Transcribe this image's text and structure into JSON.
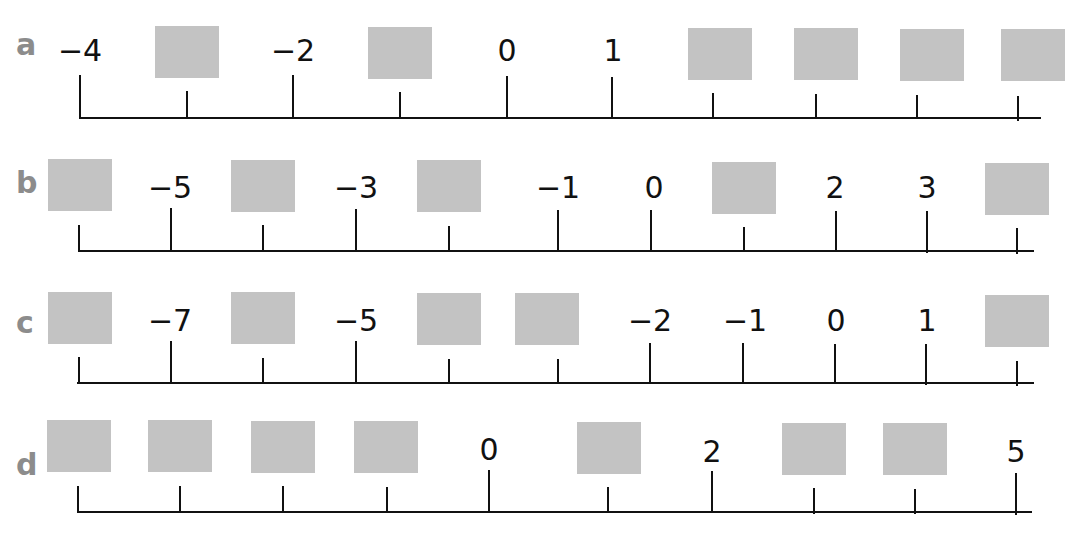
{
  "worksheet": {
    "header_fragment": "",
    "box_color": "#c3c3c3",
    "letter_color": "#8c8c8c",
    "line_color": "#111111"
  },
  "number_lines": [
    {
      "letter": "a",
      "positions": [
        {
          "value": "−4",
          "blank": false
        },
        {
          "value": "",
          "blank": true
        },
        {
          "value": "−2",
          "blank": false
        },
        {
          "value": "",
          "blank": true
        },
        {
          "value": "0",
          "blank": false
        },
        {
          "value": "1",
          "blank": false
        },
        {
          "value": "",
          "blank": true
        },
        {
          "value": "",
          "blank": true
        },
        {
          "value": "",
          "blank": true
        },
        {
          "value": "",
          "blank": true
        }
      ]
    },
    {
      "letter": "b",
      "positions": [
        {
          "value": "",
          "blank": true
        },
        {
          "value": "−5",
          "blank": false
        },
        {
          "value": "",
          "blank": true
        },
        {
          "value": "−3",
          "blank": false
        },
        {
          "value": "",
          "blank": true
        },
        {
          "value": "−1",
          "blank": false
        },
        {
          "value": "0",
          "blank": false
        },
        {
          "value": "",
          "blank": true
        },
        {
          "value": "2",
          "blank": false
        },
        {
          "value": "3",
          "blank": false
        },
        {
          "value": "",
          "blank": true
        }
      ]
    },
    {
      "letter": "c",
      "positions": [
        {
          "value": "",
          "blank": true
        },
        {
          "value": "−7",
          "blank": false
        },
        {
          "value": "",
          "blank": true
        },
        {
          "value": "−5",
          "blank": false
        },
        {
          "value": "",
          "blank": true
        },
        {
          "value": "",
          "blank": true
        },
        {
          "value": "−2",
          "blank": false
        },
        {
          "value": "−1",
          "blank": false
        },
        {
          "value": "0",
          "blank": false
        },
        {
          "value": "1",
          "blank": false
        },
        {
          "value": "",
          "blank": true
        }
      ]
    },
    {
      "letter": "d",
      "positions": [
        {
          "value": "",
          "blank": true
        },
        {
          "value": "",
          "blank": true
        },
        {
          "value": "",
          "blank": true
        },
        {
          "value": "",
          "blank": true
        },
        {
          "value": "0",
          "blank": false
        },
        {
          "value": "",
          "blank": true
        },
        {
          "value": "2",
          "blank": false
        },
        {
          "value": "",
          "blank": true
        },
        {
          "value": "",
          "blank": true
        },
        {
          "value": "5",
          "blank": false
        }
      ]
    }
  ]
}
